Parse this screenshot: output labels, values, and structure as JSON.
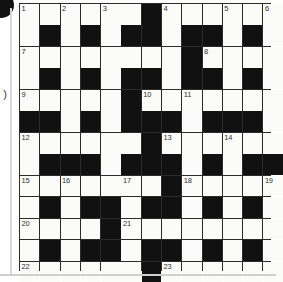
{
  "puzzle": {
    "kind": "crossword-grid",
    "title": "Crossword puzzle grid",
    "columns": 13,
    "rows": 13,
    "colors": {
      "block": "#111111",
      "cell": "#fbfbfa",
      "gridline": "#2b2b2b",
      "number_text": "#30302f"
    },
    "margin_glyph": ")",
    "clue_numbers": [
      1,
      2,
      3,
      4,
      5,
      6,
      7,
      8,
      9,
      10,
      11,
      12,
      13,
      14,
      15,
      16,
      17,
      18,
      19,
      20,
      21,
      22,
      23
    ],
    "legend": {
      "0": "white-cell",
      "1": "black-cell"
    },
    "cells": [
      [
        {
          "b": 0,
          "n": "1"
        },
        {
          "b": 0,
          "n": ""
        },
        {
          "b": 0,
          "n": "2"
        },
        {
          "b": 0,
          "n": ""
        },
        {
          "b": 0,
          "n": "3"
        },
        {
          "b": 0,
          "n": ""
        },
        {
          "b": 1,
          "n": ""
        },
        {
          "b": 0,
          "n": "4"
        },
        {
          "b": 0,
          "n": ""
        },
        {
          "b": 0,
          "n": ""
        },
        {
          "b": 0,
          "n": "5"
        },
        {
          "b": 0,
          "n": ""
        },
        {
          "b": 0,
          "n": "6"
        }
      ],
      [
        {
          "b": 0,
          "n": ""
        },
        {
          "b": 1,
          "n": ""
        },
        {
          "b": 0,
          "n": ""
        },
        {
          "b": 1,
          "n": ""
        },
        {
          "b": 0,
          "n": ""
        },
        {
          "b": 1,
          "n": ""
        },
        {
          "b": 1,
          "n": ""
        },
        {
          "b": 0,
          "n": ""
        },
        {
          "b": 1,
          "n": ""
        },
        {
          "b": 1,
          "n": ""
        },
        {
          "b": 0,
          "n": ""
        },
        {
          "b": 1,
          "n": ""
        },
        {
          "b": 0,
          "n": ""
        }
      ],
      [
        {
          "b": 0,
          "n": "7"
        },
        {
          "b": 0,
          "n": ""
        },
        {
          "b": 0,
          "n": ""
        },
        {
          "b": 0,
          "n": ""
        },
        {
          "b": 0,
          "n": ""
        },
        {
          "b": 0,
          "n": ""
        },
        {
          "b": 0,
          "n": ""
        },
        {
          "b": 0,
          "n": ""
        },
        {
          "b": 1,
          "n": ""
        },
        {
          "b": 0,
          "n": "8"
        },
        {
          "b": 0,
          "n": ""
        },
        {
          "b": 0,
          "n": ""
        },
        {
          "b": 0,
          "n": ""
        }
      ],
      [
        {
          "b": 0,
          "n": ""
        },
        {
          "b": 1,
          "n": ""
        },
        {
          "b": 0,
          "n": ""
        },
        {
          "b": 1,
          "n": ""
        },
        {
          "b": 0,
          "n": ""
        },
        {
          "b": 1,
          "n": ""
        },
        {
          "b": 1,
          "n": ""
        },
        {
          "b": 0,
          "n": ""
        },
        {
          "b": 1,
          "n": ""
        },
        {
          "b": 1,
          "n": ""
        },
        {
          "b": 0,
          "n": ""
        },
        {
          "b": 1,
          "n": ""
        },
        {
          "b": 0,
          "n": ""
        }
      ],
      [
        {
          "b": 0,
          "n": "9"
        },
        {
          "b": 0,
          "n": ""
        },
        {
          "b": 0,
          "n": ""
        },
        {
          "b": 0,
          "n": ""
        },
        {
          "b": 0,
          "n": ""
        },
        {
          "b": 1,
          "n": ""
        },
        {
          "b": 0,
          "n": "10"
        },
        {
          "b": 0,
          "n": ""
        },
        {
          "b": 0,
          "n": "11"
        },
        {
          "b": 0,
          "n": ""
        },
        {
          "b": 0,
          "n": ""
        },
        {
          "b": 0,
          "n": ""
        },
        {
          "b": 0,
          "n": ""
        }
      ],
      [
        {
          "b": 1,
          "n": ""
        },
        {
          "b": 1,
          "n": ""
        },
        {
          "b": 0,
          "n": ""
        },
        {
          "b": 1,
          "n": ""
        },
        {
          "b": 0,
          "n": ""
        },
        {
          "b": 1,
          "n": ""
        },
        {
          "b": 1,
          "n": ""
        },
        {
          "b": 1,
          "n": ""
        },
        {
          "b": 0,
          "n": ""
        },
        {
          "b": 1,
          "n": ""
        },
        {
          "b": 1,
          "n": ""
        },
        {
          "b": 1,
          "n": ""
        },
        {
          "b": 0,
          "n": ""
        }
      ],
      [
        {
          "b": 0,
          "n": "12"
        },
        {
          "b": 0,
          "n": ""
        },
        {
          "b": 0,
          "n": ""
        },
        {
          "b": 0,
          "n": ""
        },
        {
          "b": 0,
          "n": ""
        },
        {
          "b": 0,
          "n": ""
        },
        {
          "b": 1,
          "n": ""
        },
        {
          "b": 0,
          "n": "13"
        },
        {
          "b": 0,
          "n": ""
        },
        {
          "b": 0,
          "n": ""
        },
        {
          "b": 0,
          "n": "14"
        },
        {
          "b": 0,
          "n": ""
        },
        {
          "b": 0,
          "n": ""
        }
      ],
      [
        {
          "b": 0,
          "n": ""
        },
        {
          "b": 1,
          "n": ""
        },
        {
          "b": 1,
          "n": ""
        },
        {
          "b": 1,
          "n": ""
        },
        {
          "b": 0,
          "n": ""
        },
        {
          "b": 1,
          "n": ""
        },
        {
          "b": 1,
          "n": ""
        },
        {
          "b": 1,
          "n": ""
        },
        {
          "b": 0,
          "n": ""
        },
        {
          "b": 1,
          "n": ""
        },
        {
          "b": 0,
          "n": ""
        },
        {
          "b": 1,
          "n": ""
        },
        {
          "b": 1,
          "n": ""
        }
      ],
      [
        {
          "b": 0,
          "n": "15"
        },
        {
          "b": 0,
          "n": ""
        },
        {
          "b": 0,
          "n": "16"
        },
        {
          "b": 0,
          "n": ""
        },
        {
          "b": 0,
          "n": ""
        },
        {
          "b": 0,
          "n": "17"
        },
        {
          "b": 0,
          "n": ""
        },
        {
          "b": 1,
          "n": ""
        },
        {
          "b": 0,
          "n": "18"
        },
        {
          "b": 0,
          "n": ""
        },
        {
          "b": 0,
          "n": ""
        },
        {
          "b": 0,
          "n": ""
        },
        {
          "b": 0,
          "n": "19"
        }
      ],
      [
        {
          "b": 0,
          "n": ""
        },
        {
          "b": 1,
          "n": ""
        },
        {
          "b": 0,
          "n": ""
        },
        {
          "b": 1,
          "n": ""
        },
        {
          "b": 1,
          "n": ""
        },
        {
          "b": 0,
          "n": ""
        },
        {
          "b": 1,
          "n": ""
        },
        {
          "b": 1,
          "n": ""
        },
        {
          "b": 0,
          "n": ""
        },
        {
          "b": 1,
          "n": ""
        },
        {
          "b": 0,
          "n": ""
        },
        {
          "b": 1,
          "n": ""
        },
        {
          "b": 0,
          "n": ""
        }
      ],
      [
        {
          "b": 0,
          "n": "20"
        },
        {
          "b": 0,
          "n": ""
        },
        {
          "b": 0,
          "n": ""
        },
        {
          "b": 0,
          "n": ""
        },
        {
          "b": 1,
          "n": ""
        },
        {
          "b": 0,
          "n": "21"
        },
        {
          "b": 0,
          "n": ""
        },
        {
          "b": 0,
          "n": ""
        },
        {
          "b": 0,
          "n": ""
        },
        {
          "b": 0,
          "n": ""
        },
        {
          "b": 0,
          "n": ""
        },
        {
          "b": 0,
          "n": ""
        },
        {
          "b": 0,
          "n": ""
        }
      ],
      [
        {
          "b": 0,
          "n": ""
        },
        {
          "b": 1,
          "n": ""
        },
        {
          "b": 0,
          "n": ""
        },
        {
          "b": 1,
          "n": ""
        },
        {
          "b": 1,
          "n": ""
        },
        {
          "b": 0,
          "n": ""
        },
        {
          "b": 1,
          "n": ""
        },
        {
          "b": 1,
          "n": ""
        },
        {
          "b": 0,
          "n": ""
        },
        {
          "b": 1,
          "n": ""
        },
        {
          "b": 0,
          "n": ""
        },
        {
          "b": 1,
          "n": ""
        },
        {
          "b": 0,
          "n": ""
        }
      ],
      [
        {
          "b": 0,
          "n": "22"
        },
        {
          "b": 0,
          "n": ""
        },
        {
          "b": 0,
          "n": ""
        },
        {
          "b": 0,
          "n": ""
        },
        {
          "b": 0,
          "n": ""
        },
        {
          "b": 0,
          "n": ""
        },
        {
          "b": 1,
          "n": ""
        },
        {
          "b": 0,
          "n": "23"
        },
        {
          "b": 0,
          "n": ""
        },
        {
          "b": 0,
          "n": ""
        },
        {
          "b": 0,
          "n": ""
        },
        {
          "b": 0,
          "n": ""
        },
        {
          "b": 0,
          "n": ""
        }
      ]
    ]
  }
}
